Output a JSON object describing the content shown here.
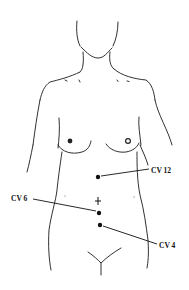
{
  "diagram": {
    "type": "anatomical-acupoint-diagram",
    "colors": {
      "line": "#1a1a1a",
      "background": "#ffffff"
    },
    "points": [
      {
        "id": "cv12",
        "label": "CV 12",
        "x": 98,
        "y": 176,
        "label_x": 150,
        "label_y": 172,
        "label_side": "right"
      },
      {
        "id": "cv6",
        "label": "CV 6",
        "x": 99,
        "y": 213,
        "label_x": 11,
        "label_y": 202,
        "label_side": "left"
      },
      {
        "id": "cv4",
        "label": "CV 4",
        "x": 100,
        "y": 225,
        "label_x": 159,
        "label_y": 247,
        "label_side": "right"
      }
    ],
    "navel_marker": {
      "x": 98,
      "y": 201
    }
  }
}
